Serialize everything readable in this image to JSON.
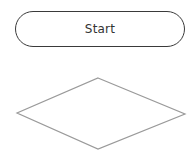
{
  "diagram": {
    "nodes": [
      {
        "id": "start",
        "shape": "terminator",
        "label": "Start",
        "stroke": "#3a3a3a"
      },
      {
        "id": "decision",
        "shape": "diamond",
        "label": "",
        "stroke": "#999999"
      }
    ]
  }
}
